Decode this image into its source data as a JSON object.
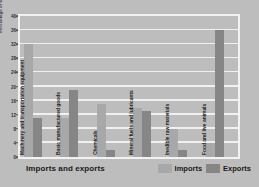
{
  "chart_data": {
    "type": "bar",
    "title": "Imports and exports",
    "xlabel": "",
    "ylabel": "Percentage of total",
    "ylim": [
      0,
      40
    ],
    "ytick_step": 4,
    "yticks": [
      0,
      4,
      8,
      12,
      16,
      20,
      24,
      28,
      32,
      36,
      40
    ],
    "grid": true,
    "legend_position": "bottom-right",
    "categories": [
      "Machinery and transportation equipment",
      "Basic manufactured goods",
      "Chemicals",
      "Mineral fuels and lubricants",
      "Inedible raw materials",
      "Food and live animals"
    ],
    "series": [
      {
        "name": "Imports",
        "color": "#a8a8a8",
        "values": [
          32,
          11,
          15,
          14,
          8,
          4
        ]
      },
      {
        "name": "Exports",
        "color": "#868686",
        "values": [
          11,
          19,
          2,
          13,
          2,
          36
        ]
      }
    ]
  },
  "legend": {
    "items": [
      {
        "label": "Imports",
        "color": "#a8a8a8"
      },
      {
        "label": "Exports",
        "color": "#868686"
      }
    ]
  },
  "colors": {
    "background": "#bdbdbd",
    "plot_background": "#bdbdbd",
    "gridline": "#f0f0f0",
    "frame": "#f2f2f2",
    "text": "#1a1a1a"
  }
}
